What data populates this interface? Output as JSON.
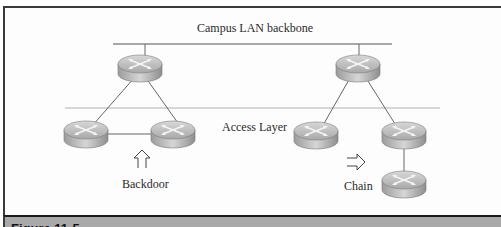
{
  "diagram": {
    "title_label": "Campus LAN backbone",
    "layer_label": "Access Layer",
    "left_group": {
      "label": "Backdoor",
      "arrow": "up-arrow"
    },
    "right_group": {
      "label": "Chain",
      "arrow": "right-arrow"
    },
    "nodes": [
      {
        "id": "core-left",
        "type": "router",
        "x": 140,
        "y": 68
      },
      {
        "id": "access-left-a",
        "type": "router",
        "x": 86,
        "y": 134
      },
      {
        "id": "access-left-b",
        "type": "router",
        "x": 173,
        "y": 134
      },
      {
        "id": "core-right",
        "type": "router",
        "x": 358,
        "y": 68
      },
      {
        "id": "access-right-a",
        "type": "router",
        "x": 316,
        "y": 135
      },
      {
        "id": "access-right-b",
        "type": "router",
        "x": 404,
        "y": 135
      },
      {
        "id": "access-right-chain",
        "type": "router",
        "x": 404,
        "y": 184
      }
    ],
    "links": [
      [
        "core-left",
        "access-left-a"
      ],
      [
        "core-left",
        "access-left-b"
      ],
      [
        "access-left-a",
        "access-left-b"
      ],
      [
        "core-right",
        "access-right-a"
      ],
      [
        "core-right",
        "access-right-b"
      ],
      [
        "access-right-b",
        "access-right-chain"
      ]
    ]
  },
  "caption": {
    "text": "Figure 11-5."
  }
}
